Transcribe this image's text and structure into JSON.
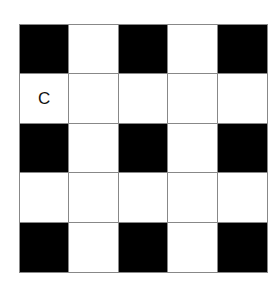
{
  "board": {
    "rows": 5,
    "cols": 5,
    "colors": {
      "black": "#000000",
      "white": "#ffffff",
      "grid": "#888888"
    },
    "cells": [
      [
        {
          "color": "black",
          "label": ""
        },
        {
          "color": "white",
          "label": ""
        },
        {
          "color": "black",
          "label": ""
        },
        {
          "color": "white",
          "label": ""
        },
        {
          "color": "black",
          "label": ""
        }
      ],
      [
        {
          "color": "white",
          "label": "C"
        },
        {
          "color": "white",
          "label": ""
        },
        {
          "color": "white",
          "label": ""
        },
        {
          "color": "white",
          "label": ""
        },
        {
          "color": "white",
          "label": ""
        }
      ],
      [
        {
          "color": "black",
          "label": ""
        },
        {
          "color": "white",
          "label": ""
        },
        {
          "color": "black",
          "label": ""
        },
        {
          "color": "white",
          "label": ""
        },
        {
          "color": "black",
          "label": ""
        }
      ],
      [
        {
          "color": "white",
          "label": ""
        },
        {
          "color": "white",
          "label": ""
        },
        {
          "color": "white",
          "label": ""
        },
        {
          "color": "white",
          "label": ""
        },
        {
          "color": "white",
          "label": ""
        }
      ],
      [
        {
          "color": "black",
          "label": ""
        },
        {
          "color": "white",
          "label": ""
        },
        {
          "color": "black",
          "label": ""
        },
        {
          "color": "white",
          "label": ""
        },
        {
          "color": "black",
          "label": ""
        }
      ]
    ]
  }
}
